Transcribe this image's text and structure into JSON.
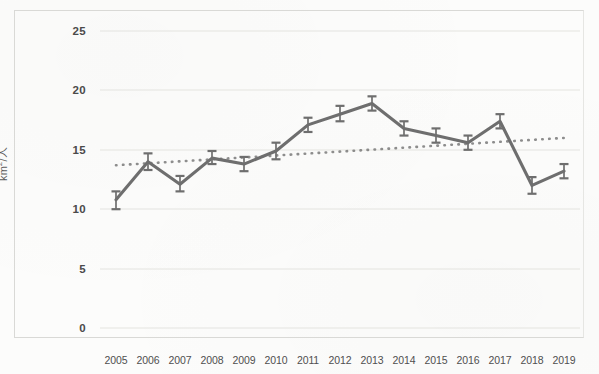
{
  "figure": {
    "kind": "scanned-line-chart",
    "background_color": "#fcfcfb",
    "ink_color": "#6e6e6e",
    "grid_color": "#e3e3e0",
    "trend_color": "#7a7a7a"
  },
  "axes": {
    "y_label_text": "km",
    "y_label_sup": "2",
    "y_label_tail": "/人",
    "y_label_full": "km2/人",
    "y_ticks": [
      "0",
      "5",
      "10",
      "15",
      "20",
      "25"
    ],
    "x_ticks": [
      "2005",
      "2006",
      "2007",
      "2008",
      "2009",
      "2010",
      "2011",
      "2012",
      "2013",
      "2014",
      "2015",
      "2016",
      "2017",
      "2018",
      "2019"
    ]
  },
  "chart_data": {
    "type": "line",
    "title": "",
    "subtitle": "",
    "xlabel": "",
    "ylabel": "km2/人",
    "ylim": [
      0,
      25
    ],
    "yticks": [
      0,
      5,
      10,
      15,
      20,
      25
    ],
    "grid": true,
    "legend": "none",
    "categories": [
      "2005",
      "2006",
      "2007",
      "2008",
      "2009",
      "2010",
      "2011",
      "2012",
      "2013",
      "2014",
      "2015",
      "2016",
      "2017",
      "2018",
      "2019"
    ],
    "x": [
      2005,
      2006,
      2007,
      2008,
      2009,
      2010,
      2011,
      2012,
      2013,
      2014,
      2015,
      2016,
      2017,
      2018,
      2019
    ],
    "series": [
      {
        "name": "km2 per person",
        "style": "line-with-error-bars",
        "values": [
          10.8,
          14.0,
          12.1,
          14.3,
          13.8,
          14.9,
          17.1,
          18.0,
          18.9,
          16.8,
          16.2,
          15.6,
          17.4,
          12.0,
          13.2
        ],
        "error_low": [
          10.0,
          13.3,
          11.5,
          13.8,
          13.2,
          14.2,
          16.5,
          17.4,
          18.3,
          16.2,
          15.6,
          15.0,
          16.8,
          11.3,
          12.6
        ],
        "error_high": [
          11.5,
          14.7,
          12.8,
          14.9,
          14.4,
          15.6,
          17.7,
          18.7,
          19.5,
          17.4,
          16.8,
          16.2,
          18.0,
          12.7,
          13.8
        ]
      },
      {
        "name": "linear trendline",
        "style": "dotted",
        "endpoints": [
          {
            "x": 2005,
            "y": 13.7
          },
          {
            "x": 2019,
            "y": 16.0
          }
        ]
      }
    ],
    "annotations": []
  }
}
